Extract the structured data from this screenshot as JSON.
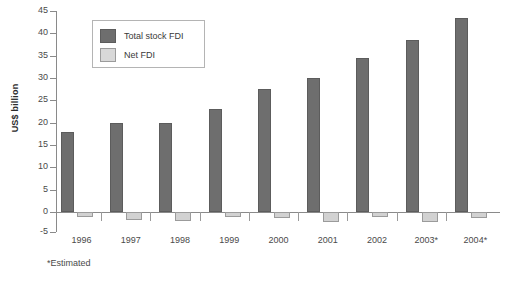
{
  "chart_data": {
    "type": "bar",
    "title": "",
    "xlabel": "",
    "ylabel": "US$ billion",
    "ylim": [
      -5,
      45
    ],
    "yticks": [
      -5,
      0,
      5,
      10,
      15,
      20,
      25,
      30,
      35,
      40,
      45
    ],
    "grid": false,
    "legend_position": "top-left",
    "categories": [
      "1996",
      "1997",
      "1998",
      "1999",
      "2000",
      "2001",
      "2002",
      "2003*",
      "2004*"
    ],
    "series": [
      {
        "name": "Total stock FDI",
        "color": "#6e6e6e",
        "values": [
          17.8,
          20.0,
          20.0,
          23.0,
          27.5,
          30.0,
          34.5,
          38.5,
          43.5
        ]
      },
      {
        "name": "Net FDI",
        "color": "#d2d2d2",
        "values": [
          -1.3,
          -2.0,
          -2.3,
          -1.3,
          -1.5,
          -2.5,
          -1.3,
          -2.5,
          -1.5
        ]
      }
    ],
    "annotations": [
      "*Estimated"
    ]
  },
  "legend": {
    "items": [
      {
        "label": "Total stock FDI"
      },
      {
        "label": "Net FDI"
      }
    ]
  },
  "footnote": "*Estimated"
}
